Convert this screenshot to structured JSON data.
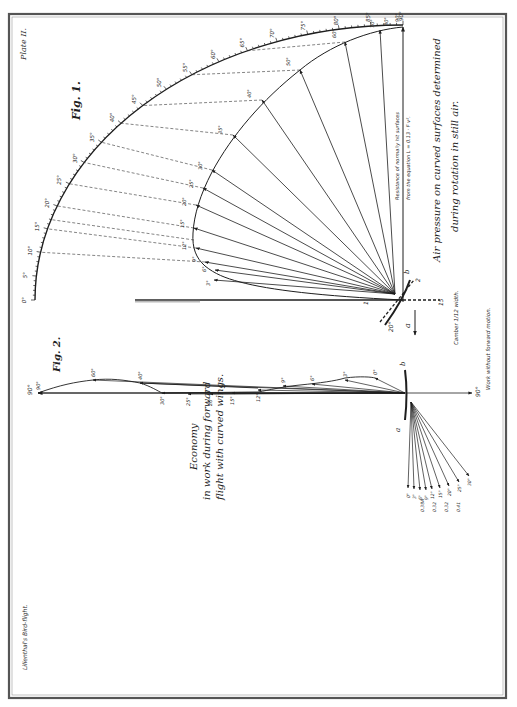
{
  "plate": {
    "plate_label": "Plate II.",
    "book_title": "Lilienthal's Bird-flight.",
    "colors": {
      "ink": "#1e1e1e",
      "paper": "#ffffff",
      "frame": "#555555"
    }
  },
  "fig1": {
    "label": "Fig. 1.",
    "caption_line1": "Air pressure on curved surfaces determined",
    "caption_line2": "during rotation in still air.",
    "axis_note_line1": "Resistance of normally hit surfaces",
    "axis_note_line2": "from the equation L = 0.13 · F v².",
    "camber_note": "Camber 1/12 width.",
    "outer_arc_ticks": [
      "0°",
      "5°",
      "10°",
      "15°",
      "20°",
      "25°",
      "30°",
      "35°",
      "40°",
      "45°",
      "50°",
      "55°",
      "60°",
      "65°",
      "70°",
      "75°",
      "80°",
      "85°",
      "90°"
    ],
    "inner_curve_labels": [
      "3°",
      "6°",
      "9°",
      "12°",
      "15°",
      "20°",
      "25°",
      "30°",
      "35°",
      "40°",
      "50°",
      "60°",
      "70°",
      "80°",
      "90°"
    ],
    "origin_labels": {
      "a": "a",
      "b": "b",
      "one": "1",
      "two": "2",
      "fifteen": "15",
      "twenty": "20°"
    }
  },
  "fig2": {
    "label": "Fig. 2.",
    "caption_line1": "Economy",
    "caption_line2": "in work during forward",
    "caption_line3": "flight with curved wings.",
    "side_note": "Work without forward motion.",
    "axis_end_label": "90°",
    "down_axis_label": "90°",
    "origin_labels": {
      "a": "a",
      "b": "b"
    },
    "polar_labels": [
      "0°",
      "3°",
      "6°",
      "9°",
      "12°",
      "15°",
      "20°",
      "25°",
      "30°",
      "40°",
      "60°",
      "90°"
    ],
    "fan_labels": [
      "0°",
      "3°",
      "6°",
      "9°",
      "12°",
      "15°",
      "20°",
      "25°",
      "30°"
    ],
    "fan_values": [
      "0.38A",
      "0.32",
      "0.32",
      "0.41"
    ]
  }
}
